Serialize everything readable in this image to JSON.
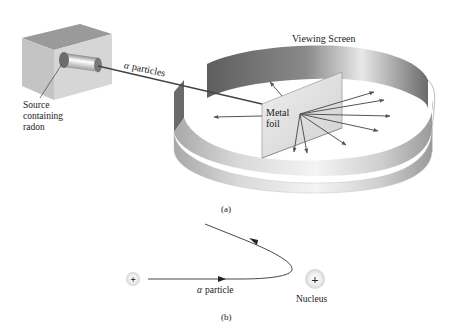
{
  "figure": {
    "panel_a": {
      "caption": "(a)",
      "labels": {
        "viewing_screen": "Viewing Screen",
        "alpha_particles": "particles",
        "alpha_symbol": "α",
        "source_line1": "Source",
        "source_line2": "containing",
        "source_line3": "radon",
        "foil_line1": "Metal",
        "foil_line2": "foil"
      },
      "scattered_ray_count": 11
    },
    "panel_b": {
      "caption": "(b)",
      "labels": {
        "alpha_symbol": "α",
        "alpha_particle": "particle",
        "nucleus": "Nucleus",
        "charge_symbol": "+"
      }
    },
    "colors": {
      "line": "#444444",
      "box_front": "#cfcfcf",
      "box_top": "#9a9a9a",
      "box_side": "#bdbdbd",
      "ring_outer_light": "#e6e6e6",
      "ring_outer_dark": "#9e9e9e",
      "ring_inner_dark": "#6e6e6e",
      "foil": "#e2e2e2",
      "text": "#222222"
    }
  }
}
